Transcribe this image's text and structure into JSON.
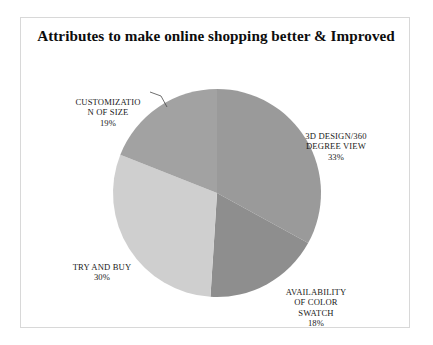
{
  "chart_title": "Attributes to make online shopping better & Improved",
  "frame": {
    "border_color": "#d8d8d8",
    "background": "#ffffff"
  },
  "labels": {
    "customization": {
      "name": "CUSTOMIZATIO\nN OF SIZE",
      "percent": "19%"
    },
    "design3d": {
      "name": "3D DESIGN/360\nDEGREE VIEW",
      "percent": "33%"
    },
    "swatch": {
      "name": "AVAILABILITY\nOF COLOR\nSWATCH",
      "percent": "18%"
    },
    "trybuy": {
      "name": "TRY AND BUY",
      "percent": "30%"
    }
  },
  "chart_data": {
    "type": "pie",
    "title": "Attributes to make online shopping better & Improved",
    "subtitle": "",
    "xlabel": "",
    "ylabel": "",
    "legend_position": "none",
    "labels_position": "outside-callouts",
    "start_angle_deg": 0,
    "direction": "clockwise",
    "center": {
      "x": 217,
      "y": 193
    },
    "radius": 104,
    "categories": [
      "3D DESIGN/360 DEGREE VIEW",
      "AVAILABILITY OF COLOR SWATCH",
      "TRY AND BUY",
      "CUSTOMIZATION OF SIZE"
    ],
    "values": [
      33,
      18,
      30,
      19
    ],
    "value_labels": [
      "33%",
      "18%",
      "30%",
      "19%"
    ],
    "units": "percent",
    "total": 100,
    "colors": [
      "#9a9a9a",
      "#8e8e8e",
      "#cfcfcf",
      "#a2a2a2"
    ],
    "slices": [
      {
        "label": "3D DESIGN/360 DEGREE VIEW",
        "value": 33,
        "value_label": "33%",
        "color": "#9a9a9a",
        "start_deg": 0,
        "end_deg": 118.8
      },
      {
        "label": "AVAILABILITY OF COLOR SWATCH",
        "value": 18,
        "value_label": "18%",
        "color": "#8e8e8e",
        "start_deg": 118.8,
        "end_deg": 183.6
      },
      {
        "label": "TRY AND BUY",
        "value": 30,
        "value_label": "30%",
        "color": "#cfcfcf",
        "start_deg": 183.6,
        "end_deg": 291.6
      },
      {
        "label": "CUSTOMIZATION OF SIZE",
        "value": 19,
        "value_label": "19%",
        "color": "#a2a2a2",
        "start_deg": 291.6,
        "end_deg": 360
      }
    ]
  }
}
